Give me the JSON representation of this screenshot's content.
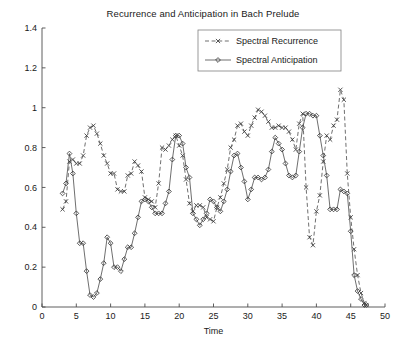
{
  "chart_data": {
    "type": "line",
    "title": "Recurrence and Anticipation in Bach Prelude",
    "xlabel": "Time",
    "ylabel": "",
    "xlim": [
      0,
      50
    ],
    "ylim": [
      0,
      1.4
    ],
    "xticks": [
      0,
      5,
      10,
      15,
      20,
      25,
      30,
      35,
      40,
      45,
      50
    ],
    "xticklabels": [
      "0",
      "5",
      "10",
      "15",
      "20",
      "25",
      "30",
      "35",
      "40",
      "45",
      "50"
    ],
    "yticks": [
      0,
      0.2,
      0.4,
      0.6,
      0.8,
      1,
      1.2,
      1.4
    ],
    "yticklabels": [
      "0",
      "0.2",
      "0.4",
      "0.6",
      "0.8",
      "1",
      "1.2",
      "1.4"
    ],
    "grid": false,
    "legend_position": "top-center-right",
    "line_color": "#555555",
    "marker_color": "#3a3a3a",
    "series": [
      {
        "name": "Spectral Recurrence",
        "marker": "x",
        "linestyle": "dashed",
        "x": [
          3,
          3.5,
          4,
          4.5,
          5,
          5.5,
          6,
          6.5,
          7,
          7.5,
          8,
          8.5,
          9,
          9.5,
          10,
          10.5,
          11,
          11.5,
          12,
          12.5,
          13,
          13.5,
          14,
          14.5,
          15,
          15.5,
          16,
          16.5,
          17,
          17.5,
          18,
          18.5,
          19,
          19.5,
          20,
          20.5,
          21,
          21.5,
          22,
          22.5,
          23,
          23.5,
          24,
          24.5,
          25,
          25.5,
          26,
          26.5,
          27,
          27.5,
          28,
          28.5,
          29,
          29.5,
          30,
          30.5,
          31,
          31.5,
          32,
          32.5,
          33,
          33.5,
          34,
          34.5,
          35,
          35.5,
          36,
          36.5,
          37,
          37.5,
          38,
          38.5,
          39,
          39.5,
          40,
          40.5,
          41,
          41.5,
          42,
          42.5,
          43,
          43.5,
          44,
          44.5,
          45,
          45.5,
          46,
          46.5,
          47,
          47.3
        ],
        "y": [
          0.49,
          0.53,
          0.73,
          0.74,
          0.72,
          0.72,
          0.76,
          0.86,
          0.9,
          0.91,
          0.87,
          0.82,
          0.76,
          0.72,
          0.67,
          0.67,
          0.59,
          0.58,
          0.58,
          0.66,
          0.67,
          0.73,
          0.71,
          0.68,
          0.55,
          0.54,
          0.53,
          0.5,
          0.62,
          0.8,
          0.79,
          0.81,
          0.84,
          0.86,
          0.81,
          0.76,
          0.64,
          0.52,
          0.48,
          0.51,
          0.51,
          0.5,
          0.45,
          0.44,
          0.43,
          0.5,
          0.55,
          0.62,
          0.69,
          0.8,
          0.84,
          0.91,
          0.92,
          0.88,
          0.86,
          0.91,
          0.95,
          0.99,
          0.98,
          0.96,
          0.93,
          0.9,
          0.9,
          0.91,
          0.9,
          0.9,
          0.88,
          0.84,
          0.79,
          0.92,
          0.97,
          0.6,
          0.35,
          0.31,
          0.48,
          0.56,
          0.73,
          0.86,
          0.84,
          0.91,
          0.94,
          1.09,
          1.04,
          0.67,
          0.45,
          0.29,
          0.16,
          0.07,
          0.02,
          0.01
        ],
        "y_min": 0.01,
        "y_max": 1.09
      },
      {
        "name": "Spectral Anticipation",
        "marker": "diamond",
        "linestyle": "solid",
        "x": [
          3,
          3.5,
          4,
          4.5,
          5,
          5.5,
          6,
          6.5,
          7,
          7.5,
          8,
          8.5,
          9,
          9.5,
          10,
          10.5,
          11,
          11.5,
          12,
          12.5,
          13,
          13.5,
          14,
          14.5,
          15,
          15.5,
          16,
          16.5,
          17,
          17.5,
          18,
          18.5,
          19,
          19.5,
          20,
          20.5,
          21,
          21.5,
          22,
          22.5,
          23,
          23.5,
          24,
          24.5,
          25,
          25.5,
          26,
          26.5,
          27,
          27.5,
          28,
          28.5,
          29,
          29.5,
          30,
          30.5,
          31,
          31.5,
          32,
          32.5,
          33,
          33.5,
          34,
          34.5,
          35,
          35.5,
          36,
          36.5,
          37,
          37.5,
          38,
          38.5,
          39,
          39.5,
          40,
          40.5,
          41,
          41.5,
          42,
          42.5,
          43,
          43.5,
          44,
          44.5,
          45,
          45.5,
          46,
          46.5,
          47,
          47.3
        ],
        "y": [
          0.57,
          0.62,
          0.77,
          0.67,
          0.47,
          0.32,
          0.32,
          0.18,
          0.06,
          0.05,
          0.07,
          0.14,
          0.22,
          0.35,
          0.32,
          0.2,
          0.2,
          0.18,
          0.24,
          0.3,
          0.3,
          0.37,
          0.45,
          0.53,
          0.54,
          0.53,
          0.5,
          0.47,
          0.47,
          0.47,
          0.52,
          0.58,
          0.74,
          0.86,
          0.86,
          0.82,
          0.7,
          0.65,
          0.47,
          0.44,
          0.41,
          0.44,
          0.47,
          0.54,
          0.53,
          0.5,
          0.48,
          0.53,
          0.59,
          0.68,
          0.76,
          0.77,
          0.7,
          0.63,
          0.54,
          0.59,
          0.65,
          0.65,
          0.64,
          0.65,
          0.69,
          0.78,
          0.85,
          0.82,
          0.79,
          0.72,
          0.66,
          0.65,
          0.66,
          0.78,
          0.9,
          0.97,
          0.97,
          0.96,
          0.96,
          0.86,
          0.76,
          0.66,
          0.49,
          0.49,
          0.49,
          0.59,
          0.58,
          0.57,
          0.38,
          0.16,
          0.08,
          0.04,
          0.01,
          0.01
        ],
        "y_min": 0.01,
        "y_max": 0.97
      }
    ]
  },
  "legend": {
    "items": [
      {
        "label": "Spectral Recurrence",
        "style": "dashed-x"
      },
      {
        "label": "Spectral Anticipation",
        "style": "solid-diamond"
      }
    ]
  }
}
